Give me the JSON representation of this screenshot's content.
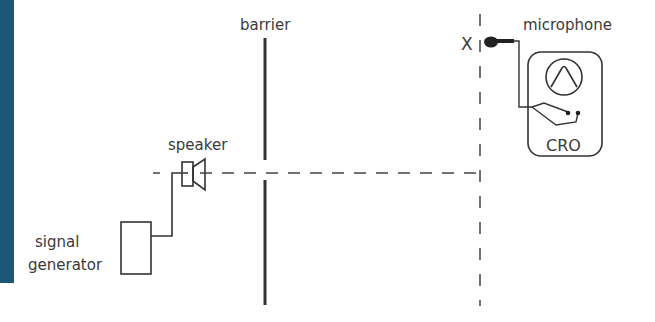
{
  "diagram": {
    "labels": {
      "barrier": "barrier",
      "speaker": "speaker",
      "signal_generator_line1": "signal",
      "signal_generator_line2": "generator",
      "microphone": "microphone",
      "point_x": "X",
      "cro": "CRO"
    },
    "colors": {
      "background": "#ffffff",
      "ink": "#333333",
      "side_stripe": "#1d5577"
    },
    "components": [
      {
        "id": "signal-generator",
        "label": "signal generator",
        "shape": "rectangle"
      },
      {
        "id": "speaker",
        "label": "speaker",
        "shape": "speaker-symbol"
      },
      {
        "id": "barrier",
        "label": "barrier",
        "shape": "vertical line with gap"
      },
      {
        "id": "microphone",
        "label": "microphone",
        "shape": "microphone-symbol"
      },
      {
        "id": "cro",
        "label": "CRO",
        "shape": "rounded rectangle with waveform screen"
      }
    ],
    "connections": [
      {
        "from": "signal-generator",
        "to": "speaker",
        "style": "solid wire"
      },
      {
        "from": "microphone",
        "to": "cro",
        "style": "solid wire"
      },
      {
        "from": "speaker",
        "to": "point-x-line",
        "style": "dashed horizontal line through barrier gap"
      }
    ],
    "reference_line": {
      "label": "X",
      "style": "dashed vertical line"
    }
  }
}
